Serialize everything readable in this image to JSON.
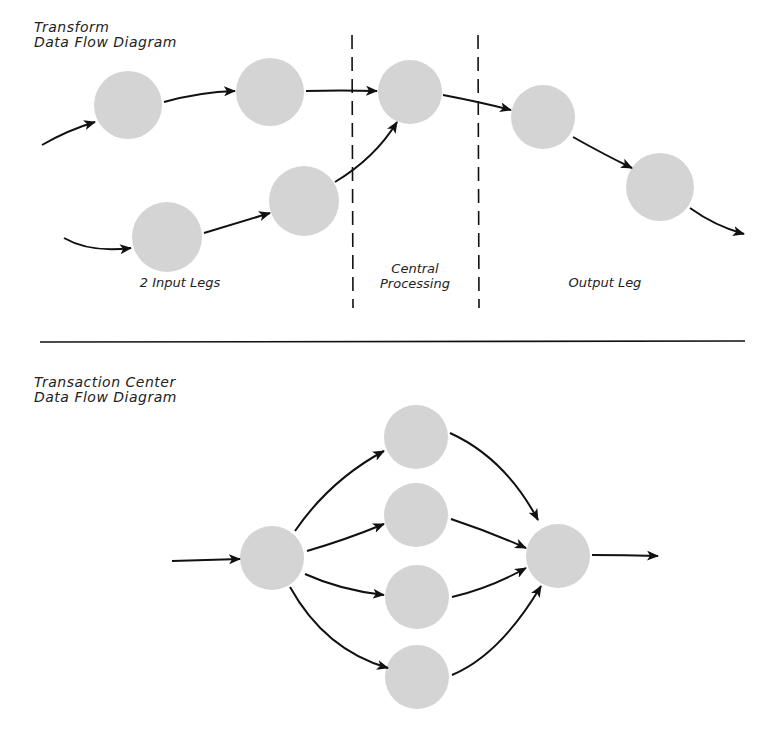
{
  "transform_diagram": {
    "title_line1": "Transform",
    "title_line2": "Data Flow Diagram",
    "regions": [
      {
        "label": "2 Input Legs"
      },
      {
        "label_line1": "Central",
        "label_line2": "Processing"
      },
      {
        "label": "Output Leg"
      }
    ],
    "nodes": [
      {
        "id": "a",
        "cx": 128,
        "cy": 105,
        "r": 34
      },
      {
        "id": "b",
        "cx": 270,
        "cy": 92,
        "r": 34
      },
      {
        "id": "c",
        "cx": 410,
        "cy": 92,
        "r": 32
      },
      {
        "id": "d",
        "cx": 543,
        "cy": 117,
        "r": 32
      },
      {
        "id": "e",
        "cx": 660,
        "cy": 187,
        "r": 34
      },
      {
        "id": "f",
        "cx": 167,
        "cy": 237,
        "r": 35
      },
      {
        "id": "g",
        "cx": 304,
        "cy": 201,
        "r": 35
      }
    ]
  },
  "transaction_diagram": {
    "title_line1": "Transaction Center",
    "title_line2": "Data Flow Diagram",
    "nodes": [
      {
        "id": "center",
        "cx": 272,
        "cy": 558,
        "r": 32
      },
      {
        "id": "t1",
        "cx": 416,
        "cy": 437,
        "r": 32
      },
      {
        "id": "t2",
        "cx": 416,
        "cy": 515,
        "r": 32
      },
      {
        "id": "t3",
        "cx": 417,
        "cy": 597,
        "r": 32
      },
      {
        "id": "t4",
        "cx": 417,
        "cy": 677,
        "r": 32
      },
      {
        "id": "merge",
        "cx": 558,
        "cy": 556,
        "r": 32
      }
    ]
  },
  "colors": {
    "node_fill": "#d4d4d4",
    "stroke": "#111111"
  }
}
